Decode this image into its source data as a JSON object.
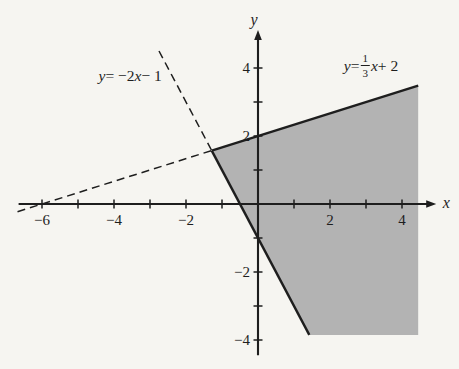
{
  "figure": {
    "background": "#f6f5f1",
    "region_fill": "#b3b3b3",
    "ink": "#1e1e1e"
  },
  "chart_data": {
    "type": "line",
    "axes": {
      "x": {
        "label": "x",
        "range": [
          -6.65,
          4.7
        ],
        "ticks": [
          -6,
          -5,
          -4,
          -3,
          -2,
          -1,
          1,
          2,
          3,
          4
        ],
        "tick_labels": [
          {
            "value": -6,
            "label": "−6"
          },
          {
            "value": -4,
            "label": "−4"
          },
          {
            "value": -2,
            "label": "−2"
          },
          {
            "value": 2,
            "label": "2"
          },
          {
            "value": 4,
            "label": "4"
          }
        ]
      },
      "y": {
        "label": "y",
        "range": [
          -4.45,
          4.85
        ],
        "ticks": [
          -4,
          -3,
          -2,
          -1,
          1,
          2,
          3,
          4
        ],
        "tick_labels": [
          {
            "value": 4,
            "label": "4"
          },
          {
            "value": 2,
            "label": "2"
          },
          {
            "value": -2,
            "label": "−2"
          },
          {
            "value": -4,
            "label": "−4"
          }
        ]
      },
      "grid": false
    },
    "lines": [
      {
        "name": "boundary-steep",
        "equation": "y = −2x − 1",
        "slope": -2,
        "intercept": -1,
        "solid_x": [
          -1.2857,
          1.425
        ],
        "dashed_x": [
          -2.75,
          -1.2857
        ],
        "label_anchor": [
          -3.55,
          3.76
        ],
        "label_parts": [
          {
            "t": "y",
            "i": true
          },
          {
            "t": " = −2"
          },
          {
            "t": "x",
            "i": true
          },
          {
            "t": " − 1"
          }
        ]
      },
      {
        "name": "boundary-shallow",
        "equation": "y = (1/3)x + 2",
        "slope": 0.333333,
        "intercept": 2,
        "solid_x": [
          -1.2857,
          4.45
        ],
        "dashed_x": [
          -6.68,
          -1.2857
        ],
        "label_anchor": [
          3.14,
          4.06
        ],
        "label_parts": [
          {
            "t": "y",
            "i": true
          },
          {
            "t": " = "
          },
          {
            "frac": [
              "1",
              "3"
            ]
          },
          {
            "t": "x",
            "i": true
          },
          {
            "t": " + 2"
          }
        ]
      }
    ],
    "intersection": [
      -1.2857,
      1.5714
    ],
    "region": {
      "satisfies": "y ≤ (1/3)x + 2 and y ≥ −2x − 1",
      "vertices": [
        [
          -1.2857,
          1.5714
        ],
        [
          4.45,
          3.4833
        ],
        [
          4.45,
          -3.85
        ],
        [
          1.425,
          -3.85
        ]
      ]
    }
  }
}
